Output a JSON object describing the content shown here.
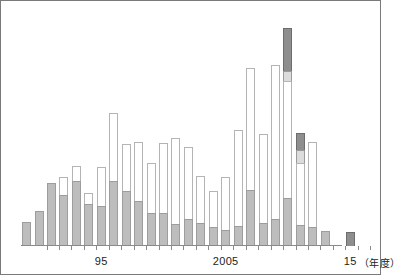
{
  "figure": {
    "title": "",
    "frame_color": "#7a7a7a",
    "background": "#ffffff"
  },
  "axis": {
    "tick_labels": [
      {
        "label": "95",
        "year": 1995
      },
      {
        "label": "2005",
        "year": 2005
      },
      {
        "label": "15",
        "year": 2015
      }
    ],
    "unit_label": "（年度）",
    "baseline_color": "#8a8a8a"
  },
  "legend_colors": {
    "series_bottom": "#bdbdbd",
    "series_middle": "#ffffff",
    "series_light": "#dcdcdc",
    "series_top": "#8e8e8e"
  },
  "chart_data": {
    "type": "bar",
    "subtype": "stacked-bar",
    "title": "",
    "subtitle": "",
    "xlabel": "（年度）",
    "ylabel": "",
    "grid": false,
    "legend_position": "none",
    "x_tick_labels": [
      "95",
      "2005",
      "15"
    ],
    "x_tick_years": [
      1995,
      2005,
      2015
    ],
    "ylim": [
      0,
      228
    ],
    "axis_note": "y-axis unlabelled; values are bar pixel heights above baseline",
    "categories": [
      1989,
      1990,
      1991,
      1992,
      1993,
      1994,
      1995,
      1996,
      1997,
      1998,
      1999,
      2000,
      2001,
      2002,
      2003,
      2004,
      2005,
      2006,
      2007,
      2008,
      2009,
      2010,
      2011,
      2012,
      2013,
      2014,
      2015
    ],
    "series": [
      {
        "name": "series-bottom",
        "color": "#bdbdbd",
        "values": [
          24,
          35,
          63,
          51,
          65,
          42,
          40,
          65,
          55,
          45,
          33,
          33,
          22,
          27,
          23,
          19,
          16,
          20,
          56,
          23,
          27,
          48,
          21,
          19,
          15,
          0,
          0
        ]
      },
      {
        "name": "series-middle",
        "color": "#ffffff",
        "values": [
          0,
          0,
          0,
          18,
          15,
          11,
          39,
          68,
          47,
          59,
          50,
          70,
          86,
          72,
          47,
          36,
          53,
          96,
          122,
          89,
          154,
          117,
          62,
          85,
          0,
          0,
          0
        ]
      },
      {
        "name": "series-light",
        "color": "#dcdcdc",
        "values": [
          0,
          0,
          0,
          0,
          0,
          0,
          0,
          0,
          0,
          0,
          0,
          0,
          0,
          0,
          0,
          0,
          0,
          0,
          0,
          0,
          0,
          10,
          13,
          0,
          0,
          0,
          0
        ]
      },
      {
        "name": "series-top",
        "color": "#8e8e8e",
        "values": [
          0,
          0,
          0,
          0,
          0,
          0,
          0,
          0,
          0,
          0,
          0,
          0,
          0,
          0,
          0,
          0,
          0,
          0,
          0,
          0,
          0,
          43,
          17,
          0,
          0,
          0,
          14
        ]
      }
    ],
    "totals": [
      24,
      35,
      63,
      69,
      80,
      53,
      79,
      133,
      102,
      104,
      83,
      103,
      108,
      99,
      70,
      55,
      69,
      116,
      178,
      112,
      181,
      218,
      113,
      104,
      15,
      0,
      14
    ]
  }
}
